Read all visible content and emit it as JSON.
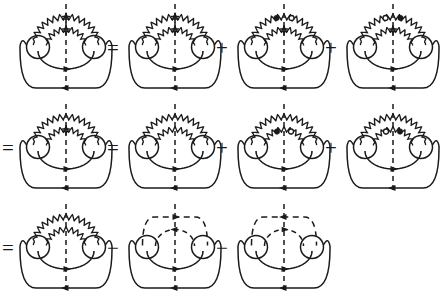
{
  "figure": {
    "stroke_color": "#1a1a1a",
    "fill_color": "#1a1a1a",
    "background": "#ffffff",
    "rows": [
      {
        "id": "row-1",
        "lead_operator": "",
        "terms": [
          {
            "id": "d1",
            "operator": "",
            "outer_line": "wavy",
            "inner_line": "wavy",
            "outer_marker": "cross",
            "inner_marker": "cross",
            "cut": "dashed-vertical"
          },
          {
            "id": "d2",
            "operator": "=",
            "outer_line": "wavy",
            "inner_line": "wavy",
            "outer_marker": "cross",
            "inner_marker": "cross",
            "cut": "dashed-vertical"
          },
          {
            "id": "d3",
            "operator": "+",
            "outer_line": "wavy",
            "inner_line": "wavy",
            "outer_marker": "filled-open",
            "inner_marker": "cross",
            "cut": "dashed-vertical"
          },
          {
            "id": "d4",
            "operator": "+",
            "outer_line": "wavy",
            "inner_line": "wavy",
            "outer_marker": "open-filled",
            "inner_marker": "cross",
            "cut": "dashed-vertical"
          }
        ]
      },
      {
        "id": "row-2",
        "lead_operator": "=",
        "terms": [
          {
            "id": "d5",
            "operator": "",
            "outer_line": "wavy",
            "inner_line": "wavy",
            "outer_marker": "none",
            "inner_marker": "cross",
            "cut": "dashed-vertical"
          },
          {
            "id": "d6",
            "operator": "=",
            "outer_line": "wavy",
            "inner_line": "wavy",
            "outer_marker": "none",
            "inner_marker": "none",
            "cut": "dashed-vertical"
          },
          {
            "id": "d7",
            "operator": "+",
            "outer_line": "wavy",
            "inner_line": "wavy",
            "outer_marker": "none",
            "inner_marker": "filled-open",
            "cut": "dashed-vertical"
          },
          {
            "id": "d8",
            "operator": "+",
            "outer_line": "wavy",
            "inner_line": "wavy",
            "outer_marker": "none",
            "inner_marker": "open-filled",
            "cut": "dashed-vertical"
          }
        ]
      },
      {
        "id": "row-3",
        "lead_operator": "=",
        "terms": [
          {
            "id": "d9",
            "operator": "",
            "outer_line": "wavy",
            "inner_line": "wavy",
            "outer_marker": "none",
            "inner_marker": "none",
            "cut": "dashed-vertical"
          },
          {
            "id": "d10",
            "operator": "−",
            "outer_line": "dashed",
            "inner_line": "dashed",
            "outer_arrow": "right",
            "inner_arrow": "left",
            "cut": "dashed-vertical"
          },
          {
            "id": "d11",
            "operator": "−",
            "outer_line": "dashed",
            "inner_line": "dashed",
            "outer_arrow": "left",
            "inner_arrow": "right",
            "cut": "dashed-vertical"
          }
        ]
      }
    ],
    "legend": {
      "filled_dot": "filled-vertex-dot",
      "open_dot": "open-vertex-circle",
      "cross_mark": "cut-tick-mark",
      "solid_line": "fermion-propagator",
      "wavy_line": "boson-propagator",
      "dashed_vertical": "unitarity-cut"
    }
  }
}
